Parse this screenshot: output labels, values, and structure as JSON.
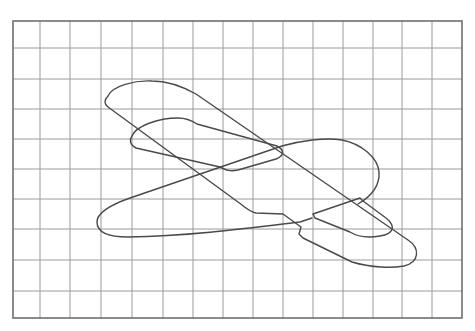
{
  "diagram": {
    "background_color": "#ffffff",
    "line_color": "#4a4a4a",
    "grid_color": "#9a9a9a",
    "grid": {
      "left": 13,
      "top": 21,
      "right": 462,
      "bottom": 318,
      "columns": 15,
      "rows": 10,
      "x_lines": [
        40,
        70,
        101,
        132,
        163,
        193,
        223,
        253,
        283,
        313,
        343,
        373,
        402,
        432
      ],
      "y_lines": [
        48,
        79,
        109,
        139,
        169,
        199,
        229,
        260,
        291
      ]
    },
    "parts": [
      {
        "name": "main-wing",
        "label": "Main wing"
      },
      {
        "name": "upper-small-wing",
        "label": "Small wing"
      },
      {
        "name": "fuselage",
        "label": "Fuselage"
      },
      {
        "name": "tail-stabilizer",
        "label": "Tail stabilizer"
      }
    ]
  }
}
